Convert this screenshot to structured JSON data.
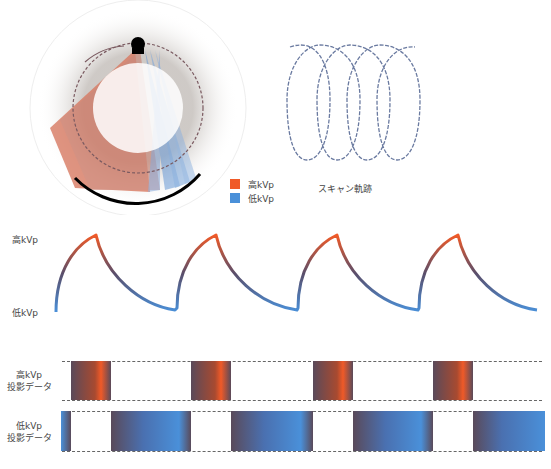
{
  "gantry": {
    "source": "x-ray-tube-icon",
    "detector": "detector-arc"
  },
  "legend": {
    "items": [
      {
        "label": "高kVp",
        "color": "#f05a28"
      },
      {
        "label": "低kVp",
        "color": "#4a90d9"
      }
    ]
  },
  "trajectory": {
    "caption": "スキャン軌跡",
    "loops": 4
  },
  "waveform": {
    "high_label": "高kVp",
    "low_label": "低kVp",
    "periods": 4
  },
  "projection": {
    "high_row_label_1": "高kVp",
    "high_row_label_2": "投影データ",
    "low_row_label_1": "低kVp",
    "low_row_label_2": "投影データ"
  },
  "colors": {
    "high": "#f05a28",
    "low": "#4a90d9",
    "mid": "#5a4a5a"
  }
}
